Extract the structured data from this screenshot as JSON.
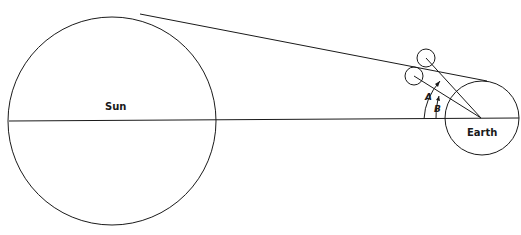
{
  "diagram": {
    "labels": {
      "sun": "Sun",
      "earth": "Earth",
      "angle_a": "A",
      "angle_b": "B"
    },
    "colors": {
      "stroke": "#1a1a1a",
      "background": "#ffffff"
    }
  }
}
